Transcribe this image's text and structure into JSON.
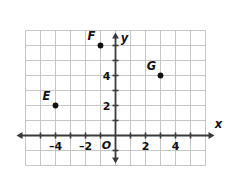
{
  "figure": {
    "kind": "coordinate-plane",
    "background_color": "#ffffff",
    "grid_color": "#bfbfbf",
    "axis_color": "#3a3a3a",
    "label_color": "#111111",
    "point_color": "#111111"
  },
  "axes": {
    "x_axis_label": "x",
    "y_axis_label": "y",
    "origin_label": "O",
    "x_tick_labels": [
      "–4",
      "–2",
      "2",
      "4"
    ],
    "y_tick_labels": [
      "2",
      "4"
    ],
    "x_ticks": [
      -4,
      -2,
      2,
      4
    ],
    "y_ticks": [
      2,
      4
    ]
  },
  "chart_data": {
    "type": "scatter",
    "title": "",
    "xlabel": "x",
    "ylabel": "y",
    "xlim": [
      -5.5,
      5.5
    ],
    "ylim": [
      -2.5,
      7.5
    ],
    "grid": true,
    "legend": "none",
    "x_ticks": [
      -4,
      -2,
      2,
      4
    ],
    "y_ticks": [
      2,
      4
    ],
    "points": [
      {
        "label": "E",
        "x": -4,
        "y": 2,
        "label_position": "upper-left"
      },
      {
        "label": "F",
        "x": -1,
        "y": 6,
        "label_position": "upper-left"
      },
      {
        "label": "G",
        "x": 3,
        "y": 4,
        "label_position": "upper-left"
      }
    ]
  }
}
